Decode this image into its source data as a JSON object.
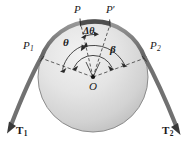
{
  "figure": {
    "type": "mechanics-diagram",
    "labels": {
      "point_top_left": "P",
      "point_top_right": "P",
      "point_top_right_prime": "′",
      "point_left": "P",
      "point_left_sub": "1",
      "point_right": "P",
      "point_right_sub": "2",
      "center": "O",
      "angle_theta": "θ",
      "angle_delta_theta": "Δθ",
      "angle_beta": "β",
      "tension_left": "T",
      "tension_left_sub": "1",
      "tension_right": "T",
      "tension_right_sub": "2"
    },
    "colors": {
      "drum_fill_light": "#e8e8e8",
      "drum_fill_dark": "#c2c2c2",
      "drum_edge": "#6e6e6e",
      "belt": "#8a8a8a",
      "belt_dark": "#5a5a5a",
      "dashed_line": "#3a3a3a",
      "label_text": "#1a1a1a",
      "background": "#ffffff"
    },
    "geometry": {
      "center_x": 93,
      "center_y": 77,
      "radius": 55,
      "canvas_width": 188,
      "canvas_height": 151
    }
  }
}
